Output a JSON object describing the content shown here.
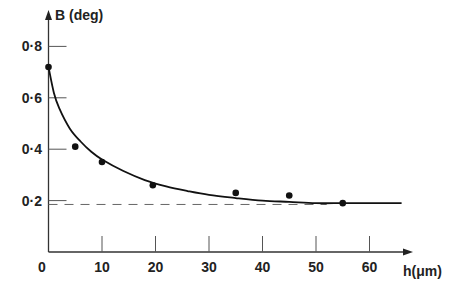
{
  "chart_data": {
    "type": "scatter",
    "title": "",
    "xlabel": "h(μm)",
    "ylabel": "B (deg)",
    "xlim": [
      0,
      68
    ],
    "ylim": [
      0,
      0.85
    ],
    "x_ticks": [
      10,
      20,
      30,
      40,
      50,
      60
    ],
    "x_tick_labels": [
      "10",
      "20",
      "30",
      "40",
      "50",
      "60"
    ],
    "origin_label": "0",
    "y_ticks": [
      0.2,
      0.4,
      0.6,
      0.8
    ],
    "y_tick_labels": [
      "0·2",
      "0·4",
      "0·6",
      "0·8"
    ],
    "grid": false,
    "legend": null,
    "series": [
      {
        "name": "measured",
        "kind": "points",
        "x": [
          0,
          5,
          10,
          19.5,
          35,
          45,
          55
        ],
        "y": [
          0.72,
          0.41,
          0.35,
          0.26,
          0.23,
          0.22,
          0.19
        ]
      },
      {
        "name": "fitted curve",
        "kind": "line",
        "x": [
          0,
          1,
          2,
          4,
          6,
          8,
          10,
          14,
          18,
          22,
          26,
          30,
          35,
          40,
          45,
          50,
          55,
          60,
          66
        ],
        "y": [
          0.72,
          0.62,
          0.56,
          0.48,
          0.43,
          0.39,
          0.36,
          0.315,
          0.28,
          0.255,
          0.237,
          0.222,
          0.21,
          0.2,
          0.195,
          0.19,
          0.19,
          0.19,
          0.19
        ]
      },
      {
        "name": "asymptote",
        "kind": "dashed-line",
        "x": [
          0,
          52
        ],
        "y": [
          0.185,
          0.185
        ]
      }
    ]
  }
}
